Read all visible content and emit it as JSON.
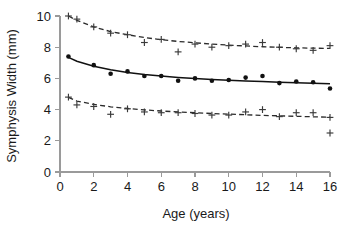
{
  "chart_data": {
    "type": "scatter",
    "title": "",
    "xlabel": "Age (years)",
    "ylabel": "Symphysis Width (mm)",
    "xlim": [
      0,
      16
    ],
    "ylim": [
      0,
      10
    ],
    "xticks": [
      0,
      2,
      4,
      6,
      8,
      10,
      12,
      14,
      16
    ],
    "yticks": [
      0,
      2,
      4,
      6,
      8,
      10
    ],
    "grid": false,
    "legend": "none",
    "series": [
      {
        "name": "Upper limit",
        "marker": "plus",
        "line_style": "dashed",
        "x": [
          0.5,
          1,
          2,
          3,
          4,
          5,
          6,
          7,
          8,
          9,
          10,
          11,
          12,
          13,
          14,
          15,
          16
        ],
        "values": [
          10.0,
          9.8,
          9.3,
          8.9,
          8.8,
          8.3,
          8.5,
          7.7,
          8.2,
          8.0,
          8.1,
          8.2,
          8.3,
          8.0,
          7.9,
          7.8,
          8.1
        ],
        "fit_x": [
          0.5,
          1,
          2,
          3,
          4,
          5,
          6,
          7,
          8,
          9,
          10,
          11,
          12,
          13,
          14,
          15,
          16
        ],
        "fit_values": [
          10.0,
          9.72,
          9.3,
          9.0,
          8.8,
          8.62,
          8.48,
          8.37,
          8.28,
          8.2,
          8.13,
          8.08,
          8.03,
          7.99,
          7.96,
          7.94,
          7.92
        ]
      },
      {
        "name": "Mean",
        "marker": "dot",
        "line_style": "solid",
        "x": [
          0.5,
          2,
          3,
          4,
          5,
          6,
          7,
          8,
          9,
          10,
          11,
          12,
          13,
          14,
          15,
          16
        ],
        "values": [
          7.4,
          6.85,
          6.3,
          6.45,
          6.15,
          6.15,
          5.85,
          6.0,
          5.85,
          5.9,
          6.05,
          6.15,
          5.7,
          5.8,
          5.75,
          5.35
        ],
        "fit_x": [
          0.5,
          1,
          2,
          3,
          4,
          5,
          6,
          7,
          8,
          9,
          10,
          11,
          12,
          13,
          14,
          15,
          16
        ],
        "fit_values": [
          7.35,
          7.1,
          6.78,
          6.55,
          6.38,
          6.25,
          6.15,
          6.06,
          5.99,
          5.93,
          5.88,
          5.84,
          5.8,
          5.76,
          5.72,
          5.69,
          5.65
        ]
      },
      {
        "name": "Lower limit",
        "marker": "plus",
        "line_style": "dashed",
        "x": [
          0.5,
          1,
          2,
          3,
          4,
          5,
          6,
          7,
          8,
          9,
          10,
          11,
          12,
          13,
          14,
          15,
          16
        ],
        "values": [
          4.8,
          4.3,
          4.2,
          3.7,
          4.05,
          3.85,
          3.8,
          3.8,
          3.75,
          3.65,
          3.65,
          3.85,
          4.0,
          3.55,
          3.8,
          3.8,
          3.5
        ],
        "fit_x": [
          0.5,
          1,
          2,
          3,
          4,
          5,
          6,
          7,
          8,
          9,
          10,
          11,
          12,
          13,
          14,
          15,
          16
        ],
        "fit_values": [
          4.78,
          4.55,
          4.33,
          4.18,
          4.07,
          3.98,
          3.91,
          3.85,
          3.8,
          3.75,
          3.71,
          3.67,
          3.63,
          3.6,
          3.57,
          3.54,
          3.51
        ]
      },
      {
        "name": "Outlier",
        "marker": "plus",
        "line_style": "none",
        "x": [
          16
        ],
        "values": [
          2.5
        ]
      }
    ]
  }
}
